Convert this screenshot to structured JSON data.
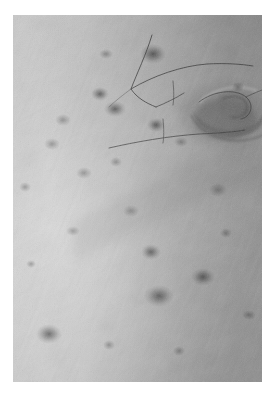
{
  "page": {
    "width": 277,
    "height": 398,
    "background_color": "#ffffff",
    "kind": "photograph",
    "caption": ""
  },
  "photo": {
    "title": "",
    "subject": "close-up of human skin showing navel, pores, freckles and fine body hairs",
    "color_mode": "grayscale",
    "frame": {
      "x": 13,
      "y": 15,
      "width": 249,
      "height": 367
    },
    "margin_color": "#ffffff",
    "tones": {
      "highlight": "#d2d2d2",
      "light_mid": "#c0c0c0",
      "mid": "#a9a9a9",
      "dark_mid": "#8e8e8e",
      "shadow": "#6f6f6f",
      "deep_shadow": "#4f4f4f",
      "hair": "#3a3a3a"
    },
    "lighting": {
      "direction": "upper-left",
      "bright_region": "left and lower-left",
      "dark_region": "upper-right and right"
    },
    "texture": {
      "grain": "fine film grain",
      "skin_lines": "diagonal criss-cross skin furrows running upper-left to lower-right",
      "pore_density": "high"
    },
    "features": [
      {
        "name": "navel",
        "shape": "crescent-fold",
        "cx": 0.84,
        "cy": 0.27,
        "rx": 0.13,
        "ry": 0.075,
        "tone": "#6b6b6b"
      },
      {
        "name": "mole",
        "shape": "blob",
        "cx": 0.56,
        "cy": 0.105,
        "rx": 0.045,
        "ry": 0.035,
        "tone": "#6c6c6c"
      },
      {
        "name": "mole",
        "shape": "blob",
        "cx": 0.375,
        "cy": 0.105,
        "rx": 0.025,
        "ry": 0.018,
        "tone": "#8a8a8a"
      },
      {
        "name": "mole",
        "shape": "blob",
        "cx": 0.35,
        "cy": 0.215,
        "rx": 0.03,
        "ry": 0.022,
        "tone": "#7e7e7e"
      },
      {
        "name": "mole",
        "shape": "blob",
        "cx": 0.41,
        "cy": 0.255,
        "rx": 0.035,
        "ry": 0.028,
        "tone": "#767676"
      },
      {
        "name": "mole",
        "shape": "blob",
        "cx": 0.2,
        "cy": 0.285,
        "rx": 0.028,
        "ry": 0.02,
        "tone": "#858585"
      },
      {
        "name": "mole",
        "shape": "blob",
        "cx": 0.575,
        "cy": 0.3,
        "rx": 0.03,
        "ry": 0.022,
        "tone": "#7c7c7c"
      },
      {
        "name": "mole",
        "shape": "blob",
        "cx": 0.675,
        "cy": 0.345,
        "rx": 0.024,
        "ry": 0.018,
        "tone": "#818181"
      },
      {
        "name": "mole",
        "shape": "blob",
        "cx": 0.155,
        "cy": 0.35,
        "rx": 0.026,
        "ry": 0.019,
        "tone": "#888888"
      },
      {
        "name": "mole",
        "shape": "blob",
        "cx": 0.415,
        "cy": 0.4,
        "rx": 0.022,
        "ry": 0.016,
        "tone": "#8b8b8b"
      },
      {
        "name": "mole",
        "shape": "blob",
        "cx": 0.285,
        "cy": 0.43,
        "rx": 0.028,
        "ry": 0.02,
        "tone": "#848484"
      },
      {
        "name": "mole",
        "shape": "blob",
        "cx": 0.555,
        "cy": 0.645,
        "rx": 0.033,
        "ry": 0.024,
        "tone": "#787878"
      },
      {
        "name": "mole",
        "shape": "blob",
        "cx": 0.765,
        "cy": 0.715,
        "rx": 0.04,
        "ry": 0.03,
        "tone": "#6e6e6e"
      },
      {
        "name": "mole",
        "shape": "blob",
        "cx": 0.585,
        "cy": 0.765,
        "rx": 0.052,
        "ry": 0.038,
        "tone": "#6a6a6a"
      },
      {
        "name": "mole",
        "shape": "blob",
        "cx": 0.145,
        "cy": 0.87,
        "rx": 0.045,
        "ry": 0.033,
        "tone": "#6d6d6d"
      },
      {
        "name": "mole",
        "shape": "blob",
        "cx": 0.905,
        "cy": 0.195,
        "rx": 0.02,
        "ry": 0.015,
        "tone": "#8c8c8c"
      },
      {
        "name": "mole",
        "shape": "blob",
        "cx": 0.05,
        "cy": 0.47,
        "rx": 0.02,
        "ry": 0.015,
        "tone": "#8f8f8f"
      }
    ],
    "hairs": [
      {
        "name": "hair-strand-upper-long",
        "path": "M 168 38 C 162 56, 152 72, 146 88 C 152 96, 160 100, 170 104"
      },
      {
        "name": "hair-strand-upper-right",
        "path": "M 146 88 C 166 76, 192 66, 216 64 C 232 63, 246 64, 256 66"
      },
      {
        "name": "hair-strand-hook",
        "path": "M 170 104 C 180 100, 190 96, 198 92"
      },
      {
        "name": "hair-strand-short-tick",
        "path": "M 224 78 L 226 100"
      },
      {
        "name": "hair-strand-mid-tick",
        "path": "M 210 118 L 212 140"
      },
      {
        "name": "hair-strand-lower-long",
        "path": "M 124 146 C 150 140, 182 134, 212 132 C 232 131, 246 130, 254 128"
      },
      {
        "name": "hair-strand-navel-curl",
        "path": "M 214 100 C 228 92, 244 92, 250 102 C 254 110, 248 118, 240 120"
      }
    ]
  }
}
